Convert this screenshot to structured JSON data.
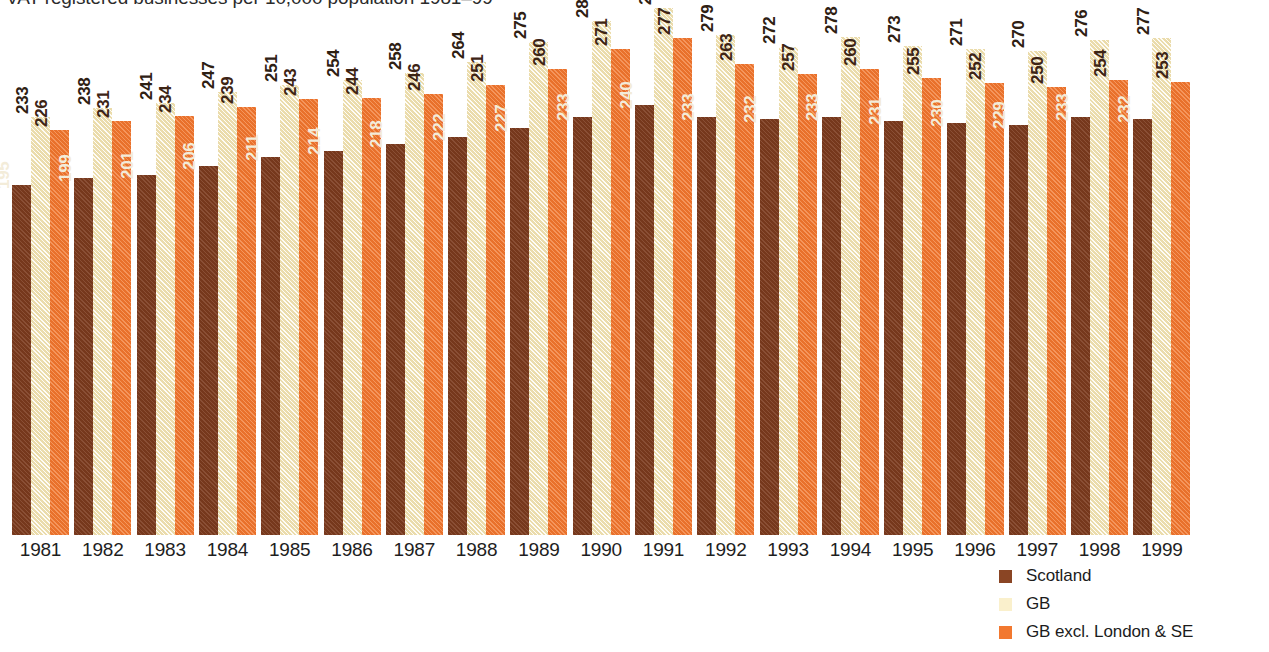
{
  "chart_data": {
    "type": "bar",
    "title": "VAT registered businesses per 10,000 population 1981–99",
    "xlabel": "",
    "ylabel": "",
    "ylim": [
      0,
      300
    ],
    "grid": false,
    "legend_position": "bottom-right",
    "categories": [
      "1981",
      "1982",
      "1983",
      "1984",
      "1985",
      "1986",
      "1987",
      "1988",
      "1989",
      "1990",
      "1991",
      "1992",
      "1993",
      "1994",
      "1995",
      "1996",
      "1997",
      "1998",
      "1999"
    ],
    "series": [
      {
        "name": "Scotland",
        "color": "#7d3b1e",
        "values": [
          195,
          199,
          201,
          206,
          211,
          214,
          218,
          222,
          227,
          233,
          240,
          233,
          232,
          233,
          231,
          230,
          229,
          233,
          232
        ]
      },
      {
        "name": "GB",
        "color": "#f7edc6",
        "values": [
          233,
          238,
          241,
          247,
          251,
          254,
          258,
          264,
          275,
          287,
          294,
          279,
          272,
          278,
          273,
          271,
          270,
          276,
          277
        ]
      },
      {
        "name": "GB excl. London & SE",
        "color": "#f2782f",
        "values": [
          226,
          231,
          234,
          239,
          243,
          244,
          246,
          251,
          260,
          271,
          277,
          263,
          257,
          260,
          255,
          252,
          250,
          254,
          253
        ]
      }
    ]
  },
  "legend": {
    "items": [
      {
        "label": "Scotland",
        "color": "#8a4524"
      },
      {
        "label": "GB",
        "color": "#faf0cc"
      },
      {
        "label": "GB excl. London & SE",
        "color": "#f2782f"
      }
    ]
  }
}
